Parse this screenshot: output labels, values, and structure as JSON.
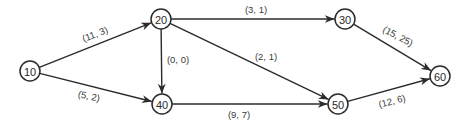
{
  "diagram": {
    "type": "network",
    "colors": {
      "stroke": "#2b2b2b",
      "text": "#3a3a3a",
      "background": "#ffffff"
    },
    "nodes": [
      {
        "id": "10",
        "label": "10",
        "x": 30,
        "y": 71
      },
      {
        "id": "20",
        "label": "20",
        "x": 161,
        "y": 19
      },
      {
        "id": "30",
        "label": "30",
        "x": 345,
        "y": 19
      },
      {
        "id": "40",
        "label": "40",
        "x": 162,
        "y": 104
      },
      {
        "id": "50",
        "label": "50",
        "x": 338,
        "y": 104
      },
      {
        "id": "60",
        "label": "60",
        "x": 440,
        "y": 76
      }
    ],
    "edges": [
      {
        "from": "10",
        "to": "20",
        "label": "(11, 3)",
        "lx": 95,
        "ly": 34,
        "rot": -21
      },
      {
        "from": "10",
        "to": "40",
        "label": "(5, 2)",
        "lx": 89,
        "ly": 96,
        "rot": 12
      },
      {
        "from": "20",
        "to": "40",
        "label": "(0, 0)",
        "lx": 178,
        "ly": 59,
        "rot": 0
      },
      {
        "from": "20",
        "to": "30",
        "label": "(3, 1)",
        "lx": 256,
        "ly": 9,
        "rot": 0
      },
      {
        "from": "20",
        "to": "50",
        "label": "(2, 1)",
        "lx": 266,
        "ly": 56,
        "rot": 0
      },
      {
        "from": "40",
        "to": "50",
        "label": "(9, 7)",
        "lx": 239,
        "ly": 114,
        "rot": 0
      },
      {
        "from": "30",
        "to": "60",
        "label": "(15, 25)",
        "lx": 398,
        "ly": 36,
        "rot": 28
      },
      {
        "from": "50",
        "to": "60",
        "label": "(12, 6)",
        "lx": 392,
        "ly": 101,
        "rot": -14
      }
    ]
  }
}
